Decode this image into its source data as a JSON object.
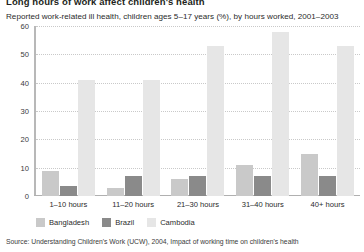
{
  "figure": {
    "title": "Long hours of work affect children's health",
    "subtitle": "Reported work-related ill health, children ages 5–17 years (%), by hours worked, 2001–2003",
    "source": "Source: Understanding Children's Work (UCW), 2004, Impact of working time on children's health"
  },
  "chart_data": {
    "type": "bar",
    "title": "Long hours of work affect children's health",
    "subtitle": "Reported work-related ill health, children ages 5–17 years (%), by hours worked, 2001–2003",
    "xlabel": "",
    "ylabel": "",
    "ylim": [
      0,
      60
    ],
    "yticks": [
      0,
      10,
      20,
      30,
      40,
      50,
      60
    ],
    "grid": true,
    "legend_position": "bottom-left",
    "categories": [
      "1–10 hours",
      "11–20 hours",
      "21–30 hours",
      "31–40 hours",
      "40+ hours"
    ],
    "series": [
      {
        "name": "Bangladesh",
        "color": "#c9c9c9",
        "values": [
          9,
          3,
          6,
          11,
          15
        ]
      },
      {
        "name": "Brazil",
        "color": "#8a8a8a",
        "values": [
          3.5,
          7,
          7,
          7,
          7
        ]
      },
      {
        "name": "Cambodia",
        "color": "#e6e6e6",
        "values": [
          41,
          41,
          53,
          58,
          53
        ]
      }
    ]
  },
  "colors": {
    "bangladesh": "#c9c9c9",
    "brazil": "#8a8a8a",
    "cambodia": "#e6e6e6",
    "axis": "#b8b8b8",
    "grid": "#c9c9c9",
    "text": "#231f20"
  }
}
